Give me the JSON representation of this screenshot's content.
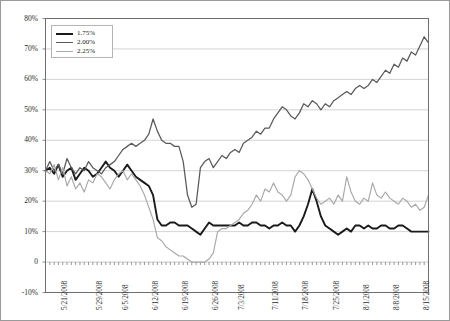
{
  "chart_data": {
    "type": "line",
    "title": "",
    "subtitle": "",
    "xlabel": "",
    "ylabel": "",
    "grid": true,
    "legend_position": "top-left",
    "ylim": [
      -10,
      80
    ],
    "ytick_labels": [
      "80%",
      "70%",
      "60%",
      "50%",
      "40%",
      "30%",
      "20%",
      "10%",
      "0",
      "-10%"
    ],
    "ytick_values": [
      80,
      70,
      60,
      50,
      40,
      30,
      20,
      10,
      0,
      -10
    ],
    "xtick_labels": [
      "5/21/2008",
      "5/29/2008",
      "6/5/2008",
      "6/12/2008",
      "6/19/2008",
      "6/26/2008",
      "7/3/2008",
      "7/11/2008",
      "7/18/2008",
      "7/25/2008",
      "8/1/2008",
      "8/8/2008",
      "8/15/2008"
    ],
    "xtick_indices": [
      3,
      11,
      17,
      24,
      31,
      38,
      44,
      52,
      59,
      66,
      73,
      80,
      87
    ],
    "n_points": 90,
    "colors": {
      "series_1_75": "#1a1a1a",
      "series_2_00": "#595959",
      "series_2_25": "#a8a8a8",
      "grid": "#c8c8c8",
      "axis": "#6e6e6e"
    },
    "series": [
      {
        "name": "1.75%",
        "color": "#1a1a1a",
        "values": [
          30,
          31,
          29,
          32,
          28,
          30,
          31,
          27,
          29,
          31,
          30,
          28,
          29,
          31,
          33,
          31,
          30,
          28,
          30,
          32,
          30,
          28,
          27,
          26,
          25,
          22,
          14,
          12,
          12,
          13,
          13,
          12,
          12,
          12,
          11,
          10,
          9,
          11,
          13,
          12,
          12,
          12,
          12,
          12,
          12,
          13,
          12,
          12,
          13,
          13,
          12,
          12,
          11,
          12,
          12,
          13,
          12,
          12,
          10,
          12,
          15,
          19,
          24,
          20,
          15,
          12,
          11,
          10,
          9,
          10,
          11,
          10,
          12,
          12,
          11,
          12,
          11,
          11,
          12,
          12,
          11,
          11,
          12,
          12,
          11,
          10,
          10,
          10,
          10,
          10
        ]
      },
      {
        "name": "2.00%",
        "color": "#595959",
        "values": [
          30,
          33,
          30,
          32,
          29,
          34,
          31,
          29,
          31,
          30,
          33,
          31,
          30,
          29,
          31,
          32,
          33,
          35,
          37,
          38,
          39,
          38,
          39,
          40,
          42,
          47,
          43,
          40,
          39,
          39,
          38,
          38,
          33,
          22,
          18,
          19,
          31,
          33,
          34,
          31,
          33,
          35,
          34,
          36,
          37,
          36,
          39,
          40,
          41,
          43,
          42,
          44,
          44,
          47,
          49,
          51,
          50,
          48,
          47,
          49,
          52,
          51,
          53,
          52,
          50,
          52,
          51,
          53,
          54,
          55,
          56,
          55,
          57,
          58,
          57,
          58,
          60,
          59,
          61,
          63,
          62,
          65,
          64,
          67,
          66,
          69,
          68,
          71,
          74,
          72
        ]
      },
      {
        "name": "2.25%",
        "color": "#a8a8a8",
        "values": [
          30,
          29,
          32,
          27,
          31,
          25,
          28,
          24,
          26,
          23,
          27,
          26,
          29,
          28,
          26,
          24,
          27,
          29,
          30,
          27,
          29,
          27,
          25,
          22,
          18,
          14,
          8,
          7,
          5,
          4,
          3,
          2,
          2,
          1,
          0,
          0,
          0,
          0,
          1,
          3,
          10,
          11,
          11,
          12,
          13,
          14,
          16,
          17,
          19,
          22,
          20,
          24,
          23,
          26,
          23,
          22,
          20,
          22,
          28,
          30,
          29,
          27,
          24,
          21,
          19,
          20,
          21,
          19,
          22,
          20,
          28,
          23,
          20,
          19,
          21,
          20,
          26,
          22,
          21,
          23,
          21,
          20,
          19,
          21,
          20,
          18,
          19,
          17,
          18,
          22
        ]
      }
    ]
  },
  "legend": {
    "items": [
      {
        "label": "1.75%",
        "color": "#1a1a1a",
        "thickness": "2.2px"
      },
      {
        "label": "2.00%",
        "color": "#595959",
        "thickness": "1.6px"
      },
      {
        "label": "2.25%",
        "color": "#a8a8a8",
        "thickness": "1.4px"
      }
    ]
  }
}
